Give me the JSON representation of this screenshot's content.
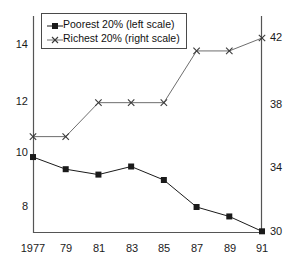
{
  "chart_data": {
    "type": "line",
    "title": "",
    "subtitle": "",
    "xlabel": "",
    "ylabel": "",
    "grid": false,
    "legend_position": "top-left",
    "x": [
      1977,
      1979,
      1981,
      1983,
      1985,
      1987,
      1989,
      1991
    ],
    "categories": [
      "1977",
      "79",
      "81",
      "83",
      "85",
      "87",
      "89",
      "91"
    ],
    "left_axis": {
      "ticks": [
        8,
        10,
        12,
        14
      ],
      "tick_labels": [
        "8",
        "10",
        "12",
        "14"
      ],
      "ylim": [
        6.8,
        15.0
      ]
    },
    "right_axis": {
      "ticks": [
        30,
        34,
        38,
        42
      ],
      "tick_labels": [
        "30",
        "34",
        "38",
        "42"
      ],
      "ylim": [
        29.0,
        42.9
      ]
    },
    "series": [
      {
        "name": "Poorest 20% (left scale)",
        "axis": "left",
        "marker": "square",
        "color": "#1a1a1a",
        "values": [
          9.85,
          9.4,
          9.2,
          9.5,
          9.0,
          8.0,
          7.65,
          7.1
        ]
      },
      {
        "name": "Richest 20% (right scale)",
        "axis": "right",
        "marker": "x",
        "color": "#6e6e6e",
        "values": [
          35.9,
          35.9,
          38.0,
          38.0,
          38.0,
          41.2,
          41.2,
          42.0
        ]
      }
    ]
  },
  "legend": {
    "items": [
      {
        "label": "Poorest 20% (left scale)",
        "marker": "square-marker"
      },
      {
        "label": "Richest 20% (right scale)",
        "marker": "x-marker"
      }
    ]
  },
  "axes": {
    "left_labels": [
      "14",
      "12",
      "10",
      "8"
    ],
    "right_labels": [
      "42",
      "38",
      "34",
      "30"
    ],
    "x_labels": [
      "1977",
      "79",
      "81",
      "83",
      "85",
      "87",
      "89",
      "91"
    ]
  }
}
